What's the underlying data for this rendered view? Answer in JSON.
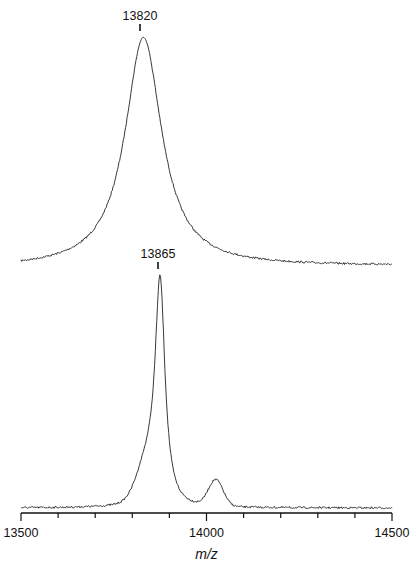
{
  "chart_data": {
    "type": "line",
    "title": "",
    "xlabel": "m/z",
    "ylabel": "",
    "xlim": [
      13500,
      14500
    ],
    "x_ticks_major": [
      13500,
      14000,
      14500
    ],
    "x_ticks_minor_step": 100,
    "grid": false,
    "legend": null,
    "series": [
      {
        "name": "upper spectrum",
        "annotation": "13820",
        "peak_mz": 13820,
        "baseline_px_left": 268,
        "baseline_px_right": 266,
        "apex_px": 37,
        "components": [
          {
            "center": 13830,
            "width": 60,
            "height": 1.0,
            "shape": "lorentzian"
          }
        ],
        "values_description": "single broad peak, apex at m/z ~13825; relative intensity 1.0, baseline ~0.0 at 13500 and 14500"
      },
      {
        "name": "lower spectrum",
        "annotation": "13865",
        "peak_mz": 13865,
        "baseline_px_left": 508,
        "baseline_px_right": 508,
        "apex_px": 275,
        "components": [
          {
            "center": 13875,
            "width": 16,
            "height": 1.0,
            "shape": "lorentzian"
          },
          {
            "center": 13840,
            "width": 40,
            "height": 0.16,
            "shape": "gauss"
          },
          {
            "center": 14025,
            "width": 28,
            "height": 0.12,
            "shape": "gauss"
          }
        ],
        "values_description": "sharp main peak at m/z ~13875 (rel. 1.0), shoulder ~13845 (~0.28), minor adduct peak ~14025 (~0.18)"
      }
    ]
  },
  "labels": {
    "x_axis_title": "m/z",
    "tick_13500": "13500",
    "tick_14000": "14000",
    "tick_14500": "14500",
    "peak_upper": "13820",
    "peak_lower": "13865"
  }
}
